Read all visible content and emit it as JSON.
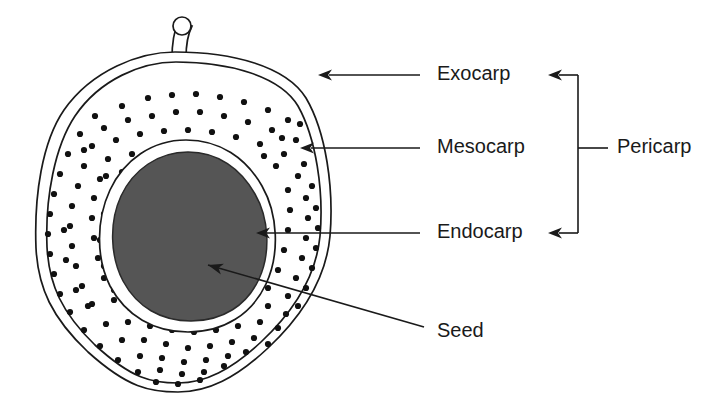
{
  "diagram": {
    "background_color": "#ffffff",
    "ink_color": "#1a1a1a",
    "seed_fill_color": "#555555"
  },
  "labels": {
    "exocarp": "Exocarp",
    "mesocarp": "Mesocarp",
    "endocarp": "Endocarp",
    "seed": "Seed",
    "pericarp": "Pericarp"
  },
  "structures": [
    {
      "name": "exocarp",
      "label": "Exocarp",
      "description": "outer skin layer of fruit",
      "label_x": 437,
      "label_y": 75,
      "leader_from_x": 420,
      "leader_to_x": 318,
      "leader_y": 75
    },
    {
      "name": "mesocarp",
      "label": "Mesocarp",
      "description": "fleshy dotted middle layer",
      "label_x": 437,
      "label_y": 148,
      "leader_from_x": 420,
      "leader_to_x": 300,
      "leader_y": 148
    },
    {
      "name": "endocarp",
      "label": "Endocarp",
      "description": "hard stony layer surrounding seed",
      "label_x": 437,
      "label_y": 233,
      "leader_from_x": 420,
      "leader_to_x": 256,
      "leader_y": 233
    },
    {
      "name": "seed",
      "label": "Seed",
      "description": "innermost kernel",
      "label_x": 437,
      "label_y": 332,
      "leader_from_x": 424,
      "leader_from_y": 327,
      "leader_to_x": 208,
      "leader_to_y": 265
    }
  ],
  "bracket": {
    "label": "Pericarp",
    "description": "bracket grouping exocarp, mesocarp and endocarp",
    "spine_x": 578,
    "top_y": 75,
    "bottom_y": 233,
    "tick_y": 148,
    "tick_end_x": 608,
    "label_x": 617,
    "label_y": 148,
    "arrow_tip_x": 548
  },
  "shapes": {
    "fruit_outer_path": "M 175 52 C 140 52 92 70 64 110 C 42 142 34 196 36 248 C 38 288 52 318 88 352 C 128 388 150 392 178 392 C 208 392 236 378 268 348 C 300 318 326 280 330 236 C 334 188 326 132 306 98 C 286 66 232 52 175 52 Z",
    "fruit_inner_path": "M 176 62 C 142 62 100 79 75 116 C 55 146 45 197 47 247 C 49 285 62 313 95 345 C 132 379 152 383 178 383 C 205 383 231 370 261 342 C 291 314 316 278 320 236 C 324 191 316 138 298 106 C 280 76 229 62 176 62 Z",
    "endocarp_ring_path": "M 186 140 C 152 140 124 160 110 190 C 96 220 96 258 110 286 C 126 316 154 332 188 332 C 224 332 252 314 266 284 C 280 254 278 214 262 186 C 246 158 220 140 186 140 Z",
    "seed_path": "M 188 152 C 158 152 133 170 121 196 C 109 222 110 256 123 281 C 137 307 161 321 191 321 C 223 321 247 305 259 279 C 271 253 269 218 255 194 C 241 169 218 152 188 152 Z",
    "stem_path": "M 178 22 C 173 34 172 44 172 58 L 186 58 C 186 44 188 34 192 26 Z",
    "stem_tip_cx": 182,
    "stem_tip_cy": 26,
    "stem_tip_r": 9
  },
  "mesocarp_dots": [
    [
      95,
      116
    ],
    [
      122,
      106
    ],
    [
      148,
      98
    ],
    [
      172,
      95
    ],
    [
      196,
      94
    ],
    [
      220,
      97
    ],
    [
      244,
      102
    ],
    [
      268,
      110
    ],
    [
      288,
      120
    ],
    [
      80,
      134
    ],
    [
      104,
      128
    ],
    [
      128,
      120
    ],
    [
      152,
      116
    ],
    [
      176,
      112
    ],
    [
      200,
      112
    ],
    [
      224,
      116
    ],
    [
      248,
      122
    ],
    [
      272,
      130
    ],
    [
      296,
      140
    ],
    [
      68,
      154
    ],
    [
      92,
      146
    ],
    [
      116,
      140
    ],
    [
      140,
      134
    ],
    [
      164,
      131
    ],
    [
      188,
      130
    ],
    [
      212,
      132
    ],
    [
      236,
      137
    ],
    [
      260,
      144
    ],
    [
      284,
      154
    ],
    [
      304,
      164
    ],
    [
      60,
      174
    ],
    [
      84,
      166
    ],
    [
      108,
      159
    ],
    [
      132,
      154
    ],
    [
      276,
      166
    ],
    [
      298,
      176
    ],
    [
      312,
      186
    ],
    [
      54,
      194
    ],
    [
      78,
      186
    ],
    [
      100,
      179
    ],
    [
      122,
      172
    ],
    [
      288,
      190
    ],
    [
      306,
      198
    ],
    [
      316,
      208
    ],
    [
      50,
      214
    ],
    [
      72,
      206
    ],
    [
      94,
      198
    ],
    [
      290,
      210
    ],
    [
      308,
      218
    ],
    [
      318,
      228
    ],
    [
      48,
      234
    ],
    [
      70,
      226
    ],
    [
      92,
      218
    ],
    [
      288,
      230
    ],
    [
      306,
      238
    ],
    [
      316,
      248
    ],
    [
      50,
      254
    ],
    [
      72,
      246
    ],
    [
      94,
      238
    ],
    [
      284,
      250
    ],
    [
      302,
      258
    ],
    [
      312,
      268
    ],
    [
      54,
      274
    ],
    [
      76,
      266
    ],
    [
      98,
      258
    ],
    [
      278,
      270
    ],
    [
      296,
      278
    ],
    [
      306,
      288
    ],
    [
      60,
      294
    ],
    [
      82,
      286
    ],
    [
      104,
      278
    ],
    [
      126,
      286
    ],
    [
      268,
      288
    ],
    [
      288,
      296
    ],
    [
      298,
      306
    ],
    [
      70,
      312
    ],
    [
      92,
      304
    ],
    [
      114,
      300
    ],
    [
      136,
      304
    ],
    [
      158,
      310
    ],
    [
      180,
      314
    ],
    [
      202,
      312
    ],
    [
      224,
      306
    ],
    [
      246,
      300
    ],
    [
      268,
      306
    ],
    [
      286,
      314
    ],
    [
      84,
      330
    ],
    [
      106,
      324
    ],
    [
      128,
      322
    ],
    [
      150,
      326
    ],
    [
      172,
      330
    ],
    [
      194,
      332
    ],
    [
      216,
      330
    ],
    [
      238,
      326
    ],
    [
      260,
      322
    ],
    [
      278,
      328
    ],
    [
      100,
      346
    ],
    [
      122,
      340
    ],
    [
      144,
      340
    ],
    [
      166,
      344
    ],
    [
      188,
      348
    ],
    [
      210,
      346
    ],
    [
      232,
      342
    ],
    [
      254,
      338
    ],
    [
      268,
      344
    ],
    [
      118,
      360
    ],
    [
      140,
      356
    ],
    [
      162,
      358
    ],
    [
      184,
      362
    ],
    [
      206,
      360
    ],
    [
      228,
      356
    ],
    [
      246,
      352
    ],
    [
      138,
      372
    ],
    [
      160,
      370
    ],
    [
      182,
      374
    ],
    [
      204,
      372
    ],
    [
      224,
      366
    ],
    [
      156,
      382
    ],
    [
      178,
      384
    ],
    [
      200,
      380
    ],
    [
      84,
      150
    ],
    [
      106,
      176
    ],
    [
      130,
      192
    ],
    [
      64,
      230
    ],
    [
      66,
      260
    ],
    [
      76,
      290
    ],
    [
      88,
      306
    ],
    [
      300,
      124
    ],
    [
      282,
      138
    ],
    [
      264,
      156
    ],
    [
      242,
      166
    ],
    [
      224,
      160
    ],
    [
      206,
      152
    ],
    [
      186,
      148
    ],
    [
      166,
      152
    ],
    [
      148,
      162
    ],
    [
      132,
      176
    ],
    [
      114,
      194
    ],
    [
      104,
      214
    ],
    [
      100,
      240
    ],
    [
      104,
      266
    ],
    [
      114,
      290
    ],
    [
      130,
      308
    ],
    [
      150,
      320
    ]
  ]
}
